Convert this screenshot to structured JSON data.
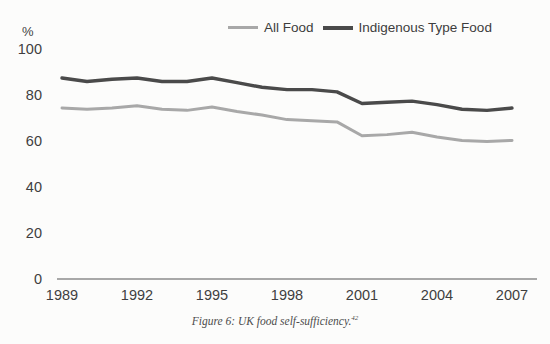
{
  "figure": {
    "caption_text": "Figure 6: UK food self-sufficiency.",
    "caption_footnote": "42"
  },
  "axis": {
    "unit_label": "%",
    "y_ticks": [
      "100",
      "80",
      "60",
      "40",
      "20",
      "0"
    ],
    "x_ticks": [
      "1989",
      "1992",
      "1995",
      "1998",
      "2001",
      "2004",
      "2007"
    ]
  },
  "legend": {
    "items": [
      {
        "label": "All Food",
        "color": "#a8a8a8"
      },
      {
        "label": "Indigenous Type Food",
        "color": "#4a4a4a"
      }
    ]
  },
  "chart_data": {
    "type": "line",
    "title": "Figure 6: UK food self-sufficiency.",
    "xlabel": "",
    "ylabel": "%",
    "xlim": [
      1989,
      2007
    ],
    "ylim": [
      0,
      100
    ],
    "grid": false,
    "legend_position": "top-right",
    "x": [
      1989,
      1990,
      1991,
      1992,
      1993,
      1994,
      1995,
      1996,
      1997,
      1998,
      1999,
      2000,
      2001,
      2002,
      2003,
      2004,
      2005,
      2006,
      2007
    ],
    "series": [
      {
        "name": "All Food",
        "color": "#a8a8a8",
        "values": [
          74,
          73.5,
          74,
          75,
          73.5,
          73,
          74.5,
          72.5,
          71,
          69,
          68.5,
          68,
          62,
          62.5,
          63.5,
          61.5,
          60,
          59.5,
          60
        ]
      },
      {
        "name": "Indigenous Type Food",
        "color": "#4a4a4a",
        "values": [
          87,
          85.5,
          86.5,
          87,
          85.5,
          85.5,
          87,
          85,
          83,
          82,
          82,
          81,
          76,
          76.5,
          77,
          75.5,
          73.5,
          73,
          74
        ]
      }
    ]
  }
}
